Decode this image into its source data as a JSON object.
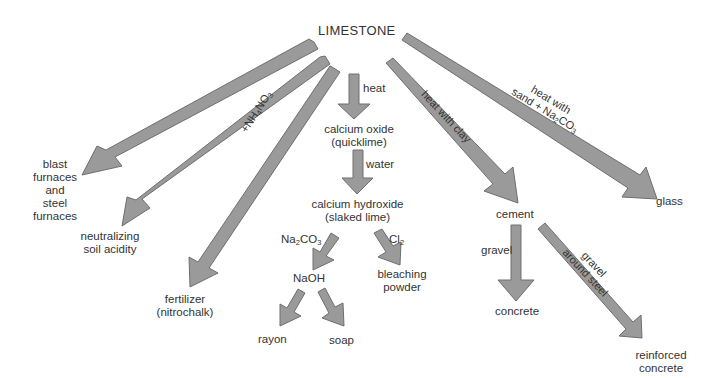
{
  "title": "LIMESTONE",
  "nodes": {
    "blast_furnaces": [
      "blast",
      "furnaces",
      "and",
      "steel",
      "furnaces"
    ],
    "neutralizing": [
      "neutralizing",
      "soil acidity"
    ],
    "fertilizer": [
      "fertilizer",
      "(nitrochalk)"
    ],
    "calcium_oxide": [
      "calcium oxide",
      "(quicklime)"
    ],
    "calcium_hydroxide": [
      "calcium hydroxide",
      "(slaked lime)"
    ],
    "naoh": "NaOH",
    "bleaching_powder": [
      "bleaching",
      "powder"
    ],
    "rayon": "rayon",
    "soap": "soap",
    "cement": "cement",
    "concrete": "concrete",
    "reinforced_concrete": [
      "reinforced",
      "concrete"
    ],
    "glass": "glass"
  },
  "edge_labels": {
    "heat": "heat",
    "water": "water",
    "na2co3": {
      "pre": "Na",
      "sub1": "2",
      "mid": "CO",
      "sub2": "3"
    },
    "cl2": {
      "pre": "Cl",
      "sub1": "2"
    },
    "nh4no3": {
      "pre": "+NH",
      "sub1": "4",
      "mid": "NO",
      "sub2": "3"
    },
    "heat_with_clay": "heat with clay",
    "heat_with_sand": {
      "line1": "heat with",
      "line2_pre": "sand + Na",
      "sub1": "2",
      "mid": "CO",
      "sub2": "3"
    },
    "gravel": "gravel",
    "gravel_around_steel": [
      "gravel",
      "around steel"
    ]
  },
  "colors": {
    "arrow_fill": "#9a9a9a",
    "arrow_edge": "#6e6e6e",
    "arrow_highlight": "#b8b8b8",
    "text": "#333333"
  }
}
